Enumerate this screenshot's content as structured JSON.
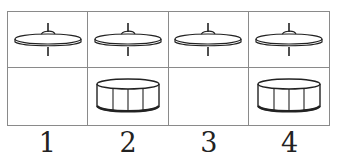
{
  "diagram": {
    "type": "drum-beat-grid",
    "rows": [
      {
        "name": "cymbal-row",
        "instrument": "cymbal-icon",
        "beats": [
          true,
          true,
          true,
          true
        ]
      },
      {
        "name": "drum-row",
        "instrument": "drum-icon",
        "beats": [
          false,
          true,
          false,
          true
        ]
      }
    ],
    "beat_labels": [
      "1",
      "2",
      "3",
      "4"
    ],
    "colors": {
      "stroke": "#222222",
      "grid": "#8a8a8a",
      "background": "#ffffff"
    }
  }
}
